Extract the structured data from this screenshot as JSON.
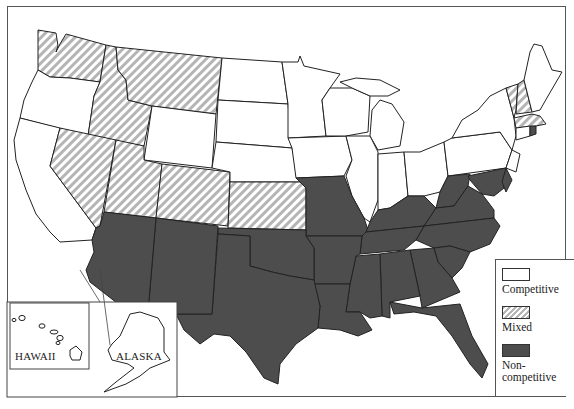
{
  "map": {
    "title": "",
    "colors": {
      "competitive": "#ffffff",
      "mixed_stripe": "#b5b5b5",
      "noncompetitive": "#4d4d4d",
      "border": "#222222"
    },
    "insets": {
      "hawaii_label": "HAWAII",
      "alaska_label": "ALASKA"
    },
    "legend": {
      "items": [
        {
          "label": "Competitive",
          "category": "competitive"
        },
        {
          "label": "Mixed",
          "category": "mixed"
        },
        {
          "label": "Non-\ncompetitive",
          "label_line1": "Non-",
          "label_line2": "competitive",
          "category": "noncompetitive"
        }
      ]
    },
    "categories": {
      "competitive": [
        "Oregon",
        "California",
        "Wyoming",
        "North Dakota",
        "South Dakota",
        "Nebraska",
        "Minnesota",
        "Iowa",
        "Wisconsin",
        "Michigan",
        "Illinois",
        "Indiana",
        "Ohio",
        "Pennsylvania",
        "New York",
        "New Jersey",
        "Connecticut",
        "Maine",
        "Hawaii",
        "Alaska"
      ],
      "mixed": [
        "Washington",
        "Idaho",
        "Montana",
        "Nevada",
        "Utah",
        "Colorado",
        "Kansas",
        "Vermont",
        "New Hampshire",
        "Massachusetts"
      ],
      "noncompetitive": [
        "Arizona",
        "New Mexico",
        "Texas",
        "Oklahoma",
        "Missouri",
        "Arkansas",
        "Louisiana",
        "Mississippi",
        "Alabama",
        "Tennessee",
        "Kentucky",
        "West Virginia",
        "Virginia",
        "North Carolina",
        "South Carolina",
        "Georgia",
        "Florida",
        "Maryland",
        "Delaware",
        "Rhode Island"
      ]
    }
  }
}
